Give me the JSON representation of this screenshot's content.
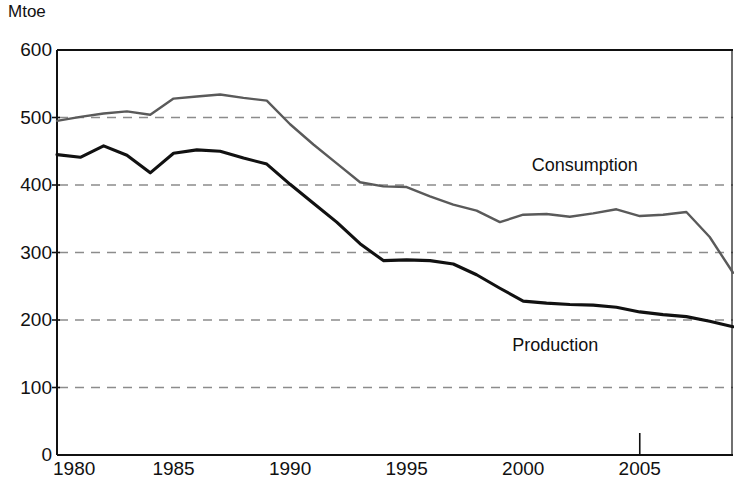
{
  "chart_data": {
    "type": "line",
    "title": "",
    "subtitle": "",
    "xlabel": "",
    "ylabel": "Mtoe",
    "unit_label": "Mtoe",
    "grid": true,
    "grid_orientation": "horizontal",
    "legend_position": "inline-annotation",
    "xlim": [
      1980,
      2009
    ],
    "ylim": [
      0,
      600
    ],
    "ytick_labels": [
      "600",
      "500",
      "400",
      "300",
      "200",
      "100",
      "0"
    ],
    "ytick_values": [
      600,
      500,
      400,
      300,
      200,
      100,
      0
    ],
    "xtick_labels": [
      "1980",
      "1985",
      "1990",
      "1995",
      "2000",
      "2005"
    ],
    "xtick_values": [
      1980,
      1985,
      1990,
      1995,
      2000,
      2005
    ],
    "x": [
      1980,
      1981,
      1982,
      1983,
      1984,
      1985,
      1986,
      1987,
      1988,
      1989,
      1990,
      1991,
      1992,
      1993,
      1994,
      1995,
      1996,
      1997,
      1998,
      1999,
      2000,
      2001,
      2002,
      2003,
      2004,
      2005,
      2006,
      2007,
      2008,
      2009
    ],
    "series": [
      {
        "name": "Consumption",
        "color": "#5a5a5a",
        "label_x": 2003.2,
        "label_y": 430,
        "values": [
          495,
          501,
          506,
          509,
          504,
          528,
          531,
          534,
          529,
          525,
          490,
          460,
          432,
          404,
          398,
          397,
          383,
          371,
          362,
          345,
          356,
          357,
          353,
          358,
          364,
          354,
          356,
          360,
          323,
          270
        ]
      },
      {
        "name": "Production",
        "color": "#111111",
        "label_x": 2001.5,
        "label_y": 163,
        "values": [
          445,
          441,
          458,
          444,
          418,
          447,
          452,
          450,
          440,
          431,
          401,
          373,
          345,
          313,
          288,
          289,
          288,
          283,
          267,
          247,
          228,
          225,
          223,
          222,
          219,
          212,
          208,
          205,
          198,
          190
        ]
      }
    ],
    "annotations": [
      {
        "text": "Consumption",
        "series": "Consumption"
      },
      {
        "text": "Production",
        "series": "Production"
      }
    ],
    "axis_color": "#111111",
    "grid_color": "#8c8c8c",
    "background": "#ffffff"
  }
}
